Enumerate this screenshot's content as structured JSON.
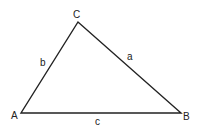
{
  "diagram": {
    "type": "triangle",
    "vertices": [
      {
        "id": "A",
        "label": "A",
        "x": 21,
        "y": 113
      },
      {
        "id": "B",
        "label": "B",
        "x": 181,
        "y": 113
      },
      {
        "id": "C",
        "label": "C",
        "x": 78,
        "y": 22
      }
    ],
    "sides": [
      {
        "id": "a",
        "label": "a",
        "from": "C",
        "to": "B"
      },
      {
        "id": "b",
        "label": "b",
        "from": "A",
        "to": "C"
      },
      {
        "id": "c",
        "label": "c",
        "from": "A",
        "to": "B"
      }
    ],
    "stroke_color": "#222222",
    "background": "#ffffff"
  }
}
